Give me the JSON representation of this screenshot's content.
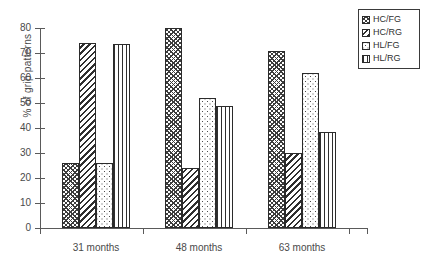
{
  "chart_data": {
    "type": "bar",
    "title": "",
    "xlabel": "",
    "ylabel": "% of grip patterns",
    "categories": [
      "31  months",
      "48  months",
      "63  months"
    ],
    "series": [
      {
        "name": "HC/FG",
        "pattern": "checker",
        "values": [
          26,
          80,
          71
        ]
      },
      {
        "name": "HC/RG",
        "pattern": "diagonal-stripe",
        "values": [
          74,
          24,
          30
        ]
      },
      {
        "name": "HL/FG",
        "pattern": "dots",
        "values": [
          26,
          52,
          62
        ]
      },
      {
        "name": "HL/RG",
        "pattern": "vertical-stripe",
        "values": [
          73.5,
          49,
          38.5
        ]
      }
    ],
    "ylim": [
      0,
      80
    ],
    "yticks": [
      0,
      10,
      20,
      30,
      40,
      50,
      60,
      70,
      80
    ],
    "ytick_labels": [
      "0",
      "10",
      "20",
      "30",
      "40",
      "50",
      "60",
      "70",
      "80"
    ],
    "grid": false,
    "legend_position": "top-right",
    "legend_entries": [
      "HC/FG",
      "HC/RG",
      "HL/FG",
      "HL/RG"
    ]
  }
}
